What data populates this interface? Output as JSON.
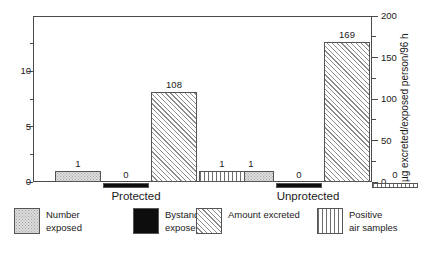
{
  "chart_data": {
    "type": "bar",
    "title": "",
    "subtitle": "",
    "xlabel": "",
    "ylabel_left": "",
    "ylabel_right": "µg excreted/exposed person/96 h",
    "categories": [
      "Protected",
      "Unprotected"
    ],
    "grid": false,
    "legend_position": "bottom",
    "left_axis": {
      "min": 0,
      "max": 15,
      "major_ticks": [
        0,
        5,
        10
      ],
      "major_tick_labels": [
        "0",
        "5",
        "10"
      ],
      "minor_ticks": [
        2.5,
        7.5,
        12.5
      ]
    },
    "right_axis": {
      "min": 0,
      "max": 200,
      "major_ticks": [
        0,
        50,
        100,
        150,
        200
      ],
      "major_tick_labels": [
        "0",
        "50",
        "100",
        "150",
        "200"
      ],
      "minor_ticks": [
        25,
        75,
        125,
        175
      ]
    },
    "series": [
      {
        "name": "Number exposed",
        "legend_label_line1": "Number",
        "legend_label_line2": "exposed",
        "pattern": "stipple",
        "color": "#dcdcdc",
        "axis": "left",
        "values": [
          1,
          1
        ],
        "value_labels": [
          "1",
          "1"
        ]
      },
      {
        "name": "Bystanders exposed",
        "legend_label_line1": "Bystanders",
        "legend_label_line2": "exposed",
        "pattern": "solid-black",
        "color": "#0d0d0d",
        "axis": "left",
        "values": [
          0,
          0
        ],
        "value_labels": [
          "0",
          "0"
        ]
      },
      {
        "name": "Amount excreted",
        "legend_label_line1": "Amount excreted",
        "legend_label_line2": "",
        "pattern": "diagonal-hatch",
        "color": "#8c8c8c",
        "axis": "right",
        "values": [
          108,
          169
        ],
        "value_labels": [
          "108",
          "169"
        ]
      },
      {
        "name": "Positive air samples",
        "legend_label_line1": "Positive",
        "legend_label_line2": "air samples",
        "pattern": "vertical-stripe",
        "color": "#6e6e6e",
        "axis": "left",
        "values": [
          1,
          0
        ],
        "value_labels": [
          "1",
          "0"
        ]
      }
    ]
  },
  "legend": {
    "items": [
      {
        "label_line1": "Number",
        "label_line2": "exposed"
      },
      {
        "label_line1": "Bystanders",
        "label_line2": "exposed"
      },
      {
        "label_line1": "Amount excreted",
        "label_line2": ""
      },
      {
        "label_line1": "Positive",
        "label_line2": "air samples"
      }
    ]
  }
}
